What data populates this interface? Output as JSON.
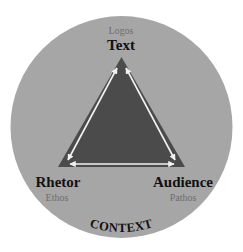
{
  "diagram": {
    "colors": {
      "background": "#ffffff",
      "circle_fill": "#a6a6a6",
      "triangle_fill": "#4b4b4b",
      "arrow_color": "#f2f2f2",
      "main_label": "#111111",
      "sub_label": "#6e6e6e"
    },
    "vertices": {
      "top": {
        "label": "Text",
        "appeal": "Logos"
      },
      "left": {
        "label": "Rhetor",
        "appeal": "Ethos"
      },
      "right": {
        "label": "Audience",
        "appeal": "Pathos"
      }
    },
    "context_label": "CONTEXT",
    "edges": [
      {
        "from": "Rhetor",
        "to": "Text",
        "type": "double-arrow"
      },
      {
        "from": "Text",
        "to": "Audience",
        "type": "double-arrow"
      },
      {
        "from": "Rhetor",
        "to": "Audience",
        "type": "double-arrow"
      }
    ]
  }
}
